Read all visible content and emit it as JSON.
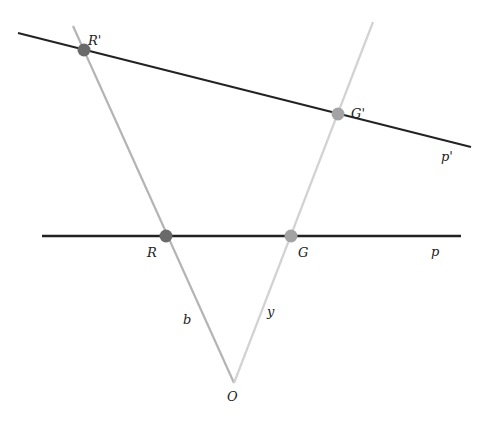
{
  "diagram": {
    "type": "geometry-projection",
    "colors": {
      "background": "#ffffff",
      "line_dark": "#222222",
      "ray_b": "#b4b4b4",
      "ray_y": "#d2d2d2",
      "point_r": "#6a6a6a",
      "point_g": "#a3a3a3"
    },
    "lines": [
      {
        "id": "p_prime",
        "label": "p'",
        "x1": 18,
        "y1": 33,
        "x2": 471,
        "y2": 147
      },
      {
        "id": "p",
        "label": "p",
        "x1": 42,
        "y1": 236,
        "x2": 461,
        "y2": 236
      }
    ],
    "rays": [
      {
        "id": "b",
        "label": "b",
        "x1": 234,
        "y1": 383,
        "x2": 73,
        "y2": 26
      },
      {
        "id": "y",
        "label": "y",
        "x1": 234,
        "y1": 383,
        "x2": 373,
        "y2": 22
      }
    ],
    "points": [
      {
        "id": "R_prime",
        "label": "R'",
        "x": 84,
        "y": 50,
        "lx": 88,
        "ly": 45
      },
      {
        "id": "G_prime",
        "label": "G'",
        "x": 338,
        "y": 114,
        "lx": 351,
        "ly": 113
      },
      {
        "id": "R",
        "label": "R",
        "x": 166,
        "y": 236,
        "lx": 147,
        "ly": 257
      },
      {
        "id": "G",
        "label": "G",
        "x": 291,
        "y": 236,
        "lx": 298,
        "ly": 257
      }
    ],
    "labels": {
      "O": "O",
      "b": "b",
      "y": "y",
      "p": "p",
      "p_prime": "p'"
    }
  }
}
